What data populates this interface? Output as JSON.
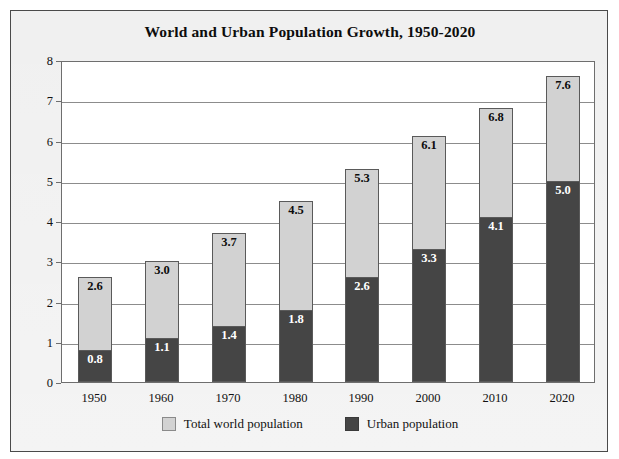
{
  "chart_data": {
    "type": "bar",
    "subtype": "stacked-overlay",
    "title": "World and Urban Population Growth, 1950-2020",
    "xlabel": "",
    "ylabel": "Population in billions",
    "ylim": [
      0,
      8
    ],
    "yticks": [
      0,
      1,
      2,
      3,
      4,
      5,
      6,
      7,
      8
    ],
    "ytick_labels": [
      "0",
      "1",
      "2",
      "3",
      "4",
      "5",
      "6",
      "7",
      "8"
    ],
    "grid": true,
    "grid_axis": "y",
    "legend_position": "bottom-center",
    "categories": [
      "1950",
      "1960",
      "1970",
      "1980",
      "1990",
      "2000",
      "2010",
      "2020"
    ],
    "series": [
      {
        "name": "Total world population",
        "color": "#d2d2d2",
        "values": [
          2.6,
          3.0,
          3.7,
          4.5,
          5.3,
          6.1,
          6.8,
          7.6
        ],
        "labels": [
          "2.6",
          "3.0",
          "3.7",
          "4.5",
          "5.3",
          "6.1",
          "6.8",
          "7.6"
        ]
      },
      {
        "name": "Urban population",
        "color": "#454545",
        "values": [
          0.8,
          1.1,
          1.4,
          1.8,
          2.6,
          3.3,
          4.1,
          5.0
        ],
        "labels": [
          "0.8",
          "1.1",
          "1.4",
          "1.8",
          "2.6",
          "3.3",
          "4.1",
          "5.0"
        ]
      }
    ]
  },
  "legend": {
    "items": [
      {
        "label": "Total world population",
        "swatch": "light-gray-swatch-icon"
      },
      {
        "label": "Urban population",
        "swatch": "dark-gray-swatch-icon"
      }
    ]
  },
  "colors": {
    "total_population": "#d2d2d2",
    "urban_population": "#454545",
    "plot_background": "#ffffff",
    "figure_background": "#ebebeb",
    "gridline": "#8c8c8c",
    "frame_border": "#4a4a4a",
    "text": "#111111"
  }
}
